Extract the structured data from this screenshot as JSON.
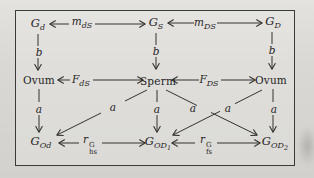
{
  "figure_type": "path-diagram",
  "colors": {
    "paper": "#d8d6d2",
    "ink": "#34322e",
    "frame": "#3c3a36"
  },
  "nodes": {
    "g_d": {
      "base": "G",
      "sub": "d"
    },
    "g_S": {
      "base": "G",
      "sub": "S"
    },
    "g_D": {
      "base": "G",
      "sub": "D"
    },
    "ovum_left": "Ovum",
    "sperm": "Sperm",
    "ovum_right": "Ovum",
    "g_Od": {
      "base": "G",
      "sub": "Od"
    },
    "g_OD1": {
      "base": "G",
      "sub": "OD",
      "subsub": "1"
    },
    "g_OD2": {
      "base": "G",
      "sub": "OD",
      "subsub": "2"
    }
  },
  "edges": {
    "m_dS": {
      "base": "m",
      "sub": "dS"
    },
    "m_DS": {
      "base": "m",
      "sub": "DS"
    },
    "F_dS": {
      "base": "F",
      "sub": "dS"
    },
    "F_DS": {
      "base": "F",
      "sub": "DS"
    },
    "r_hs": {
      "base": "r",
      "sup": "G",
      "sub": "hs"
    },
    "r_fs": {
      "base": "r",
      "sup": "G",
      "sub": "fs"
    },
    "b": "b",
    "a": "a"
  }
}
